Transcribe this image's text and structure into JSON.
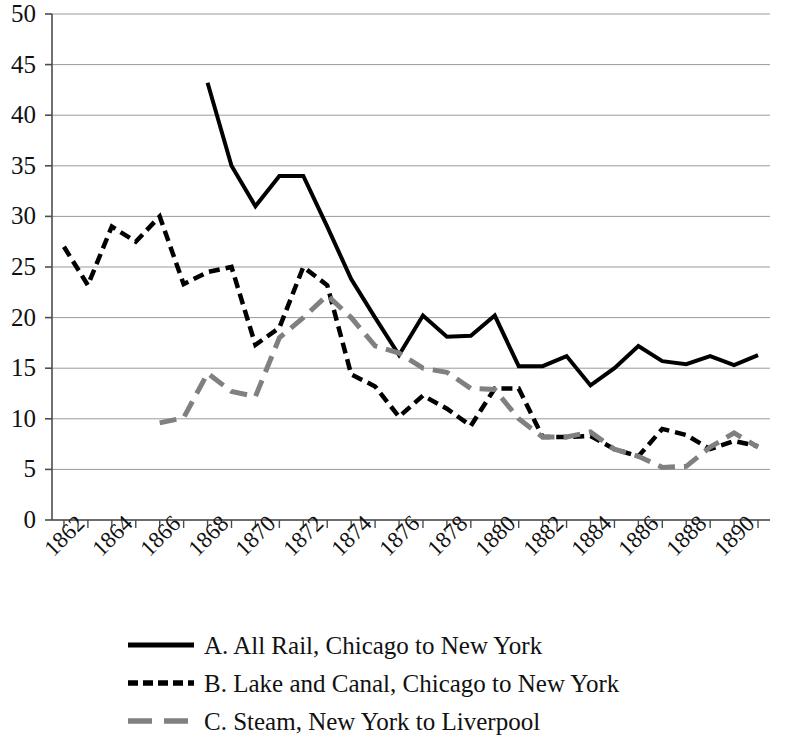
{
  "chart_data": {
    "type": "line",
    "title": "",
    "subtitle": "",
    "xlabel": "",
    "ylabel": "",
    "xlim": [
      1861.5,
      1891.5
    ],
    "ylim": [
      0,
      50
    ],
    "grid": true,
    "grid_axis": "y",
    "legend_position": "bottom",
    "y_ticks": [
      0,
      5,
      10,
      15,
      20,
      25,
      30,
      35,
      40,
      45,
      50
    ],
    "y_tick_labels": [
      "0",
      "5",
      "10",
      "15",
      "20",
      "25",
      "30",
      "35",
      "40",
      "45",
      "50"
    ],
    "x_tick_labels": [
      "1862",
      "1864",
      "1866",
      "1868",
      "1870",
      "1872",
      "1874",
      "1876",
      "1878",
      "1880",
      "1882",
      "1884",
      "1886",
      "1888",
      "1890"
    ],
    "x_tick_values": [
      1862,
      1864,
      1866,
      1868,
      1870,
      1872,
      1874,
      1876,
      1878,
      1880,
      1882,
      1884,
      1886,
      1888,
      1890
    ],
    "x_minor_ticks": [
      1862,
      1863,
      1864,
      1865,
      1866,
      1867,
      1868,
      1869,
      1870,
      1871,
      1872,
      1873,
      1874,
      1875,
      1876,
      1877,
      1878,
      1879,
      1880,
      1881,
      1882,
      1883,
      1884,
      1885,
      1886,
      1887,
      1888,
      1889,
      1890,
      1891
    ],
    "series": [
      {
        "name": "A. All Rail, Chicago to New York",
        "key": "A",
        "style": "solid",
        "color": "#000000",
        "width": 4,
        "x": [
          1868,
          1869,
          1870,
          1871,
          1872,
          1873,
          1874,
          1875,
          1876,
          1877,
          1878,
          1879,
          1880,
          1881,
          1882,
          1883,
          1884,
          1885,
          1886,
          1887,
          1888,
          1889,
          1890,
          1891
        ],
        "values": [
          43.2,
          35.0,
          31.0,
          34.0,
          34.0,
          29.0,
          23.8,
          20.0,
          16.3,
          20.2,
          18.1,
          18.2,
          20.2,
          15.2,
          15.2,
          16.2,
          13.3,
          15.0,
          17.2,
          15.7,
          15.4,
          16.2,
          15.3,
          16.3
        ]
      },
      {
        "name": "B. Lake and Canal, Chicago to New York",
        "key": "B",
        "style": "dashed",
        "color": "#000000",
        "width": 4.5,
        "x": [
          1862,
          1863,
          1864,
          1865,
          1866,
          1867,
          1868,
          1869,
          1870,
          1871,
          1872,
          1873,
          1874,
          1875,
          1876,
          1877,
          1878,
          1879,
          1880,
          1881,
          1882,
          1883,
          1884,
          1885,
          1886,
          1887,
          1888,
          1889,
          1890,
          1891
        ],
        "values": [
          27.0,
          23.2,
          29.0,
          27.5,
          30.0,
          23.3,
          24.5,
          25.0,
          17.3,
          19.0,
          25.0,
          23.2,
          14.4,
          13.2,
          10.2,
          12.3,
          11.0,
          9.3,
          13.0,
          13.0,
          8.2,
          8.2,
          8.3,
          7.0,
          6.3,
          9.0,
          8.4,
          7.0,
          7.8,
          7.3
        ]
      },
      {
        "name": "C. Steam, New York to Liverpool",
        "key": "C",
        "style": "dashed",
        "color": "#808080",
        "width": 5,
        "x": [
          1866,
          1867,
          1868,
          1869,
          1870,
          1871,
          1872,
          1873,
          1874,
          1875,
          1876,
          1877,
          1878,
          1879,
          1880,
          1881,
          1882,
          1883,
          1884,
          1885,
          1886,
          1887,
          1888,
          1889,
          1890,
          1891
        ],
        "values": [
          9.6,
          10.1,
          14.5,
          12.7,
          12.2,
          18.0,
          20.0,
          22.2,
          20.0,
          17.2,
          16.5,
          15.0,
          14.6,
          13.0,
          12.9,
          10.0,
          8.2,
          8.2,
          8.7,
          7.0,
          6.3,
          5.2,
          5.3,
          7.2,
          8.6,
          7.2
        ]
      }
    ]
  },
  "legend": {
    "items": [
      {
        "label": "A. All Rail, Chicago to New York",
        "style": "solid",
        "color": "#000000"
      },
      {
        "label": "B. Lake and Canal, Chicago to New York",
        "style": "dashed",
        "color": "#000000"
      },
      {
        "label": "C. Steam, New York to Liverpool",
        "style": "dashed-gray",
        "color": "#808080"
      }
    ]
  },
  "colors": {
    "axis": "#4d4d4d",
    "grid": "#9a9a9a",
    "series_a": "#000000",
    "series_b": "#000000",
    "series_c": "#808080",
    "background": "#ffffff"
  }
}
